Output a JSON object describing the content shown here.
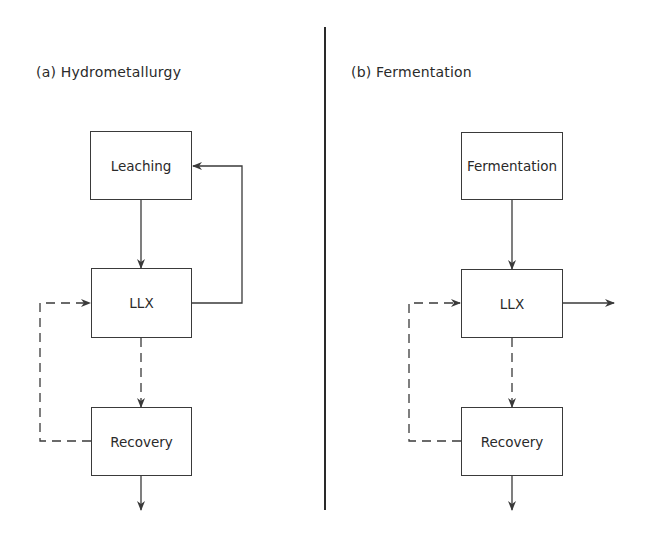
{
  "panels": [
    {
      "title": "(a) Hydrometallurgy",
      "boxes": [
        "Leaching",
        "LLX",
        "Recovery"
      ],
      "flows": [
        {
          "from": "Leaching",
          "to": "LLX",
          "style": "solid"
        },
        {
          "from": "LLX",
          "to": "Leaching",
          "style": "solid",
          "note": "recycle loop on right"
        },
        {
          "from": "LLX",
          "to": "Recovery",
          "style": "dashed"
        },
        {
          "from": "Recovery",
          "to": "LLX",
          "style": "dashed",
          "note": "recycle loop on left"
        },
        {
          "from": "Recovery",
          "to": "out",
          "style": "solid"
        }
      ]
    },
    {
      "title": "(b) Fermentation",
      "boxes": [
        "Fermentation",
        "LLX",
        "Recovery"
      ],
      "flows": [
        {
          "from": "Fermentation",
          "to": "LLX",
          "style": "solid"
        },
        {
          "from": "LLX",
          "to": "out",
          "style": "solid",
          "note": "exit to right"
        },
        {
          "from": "LLX",
          "to": "Recovery",
          "style": "dashed"
        },
        {
          "from": "Recovery",
          "to": "LLX",
          "style": "dashed",
          "note": "recycle loop on left"
        },
        {
          "from": "Recovery",
          "to": "out",
          "style": "solid"
        }
      ]
    }
  ],
  "colors": {
    "line": "#3a3a3a",
    "background": "#ffffff"
  }
}
